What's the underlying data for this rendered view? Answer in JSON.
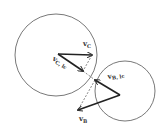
{
  "diagram": {
    "colors": {
      "stroke": "#333333",
      "background": "#ffffff"
    },
    "circles": [
      {
        "name": "body-C",
        "cx": 56,
        "cy": 55,
        "r": 41
      },
      {
        "name": "body-B",
        "cx": 125,
        "cy": 91,
        "r": 30
      }
    ],
    "vectors": [
      {
        "name": "v_C",
        "x1": 58,
        "y1": 54,
        "x2": 92,
        "y2": 55,
        "label": "v",
        "sub": "C",
        "lx": 83,
        "ly": 45
      },
      {
        "name": "v_C_lc",
        "x1": 58,
        "y1": 54,
        "x2": 83,
        "y2": 71,
        "label": "v",
        "sub": "C, lc",
        "lx": 53,
        "ly": 59
      },
      {
        "name": "v_B_lc",
        "x1": 120,
        "y1": 95,
        "x2": 95,
        "y2": 80,
        "label": "v",
        "sub": "B, lc",
        "lx": 108,
        "ly": 78
      },
      {
        "name": "v_B",
        "x1": 120,
        "y1": 95,
        "x2": 78,
        "y2": 110,
        "label": "v",
        "sub": "B",
        "lx": 80,
        "ly": 121
      }
    ],
    "labels": {
      "vC": "v",
      "vC_sub": "C",
      "vClc": "v",
      "vClc_sub": "C, lc",
      "vBlc": "v",
      "vBlc_sub": "B, lc",
      "vB": "v",
      "vB_sub": "B"
    }
  }
}
